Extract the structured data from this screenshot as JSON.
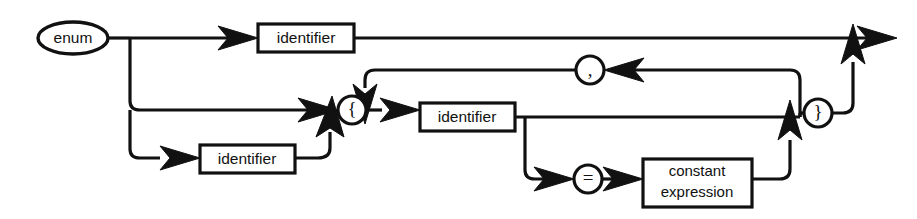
{
  "diagram": {
    "kind": "railroad-syntax-diagram",
    "title": "enum",
    "width": 917,
    "height": 219,
    "background_color": "#ffffff",
    "line_color": "#111111",
    "nodes": {
      "keyword_enum": "enum",
      "identifier_tag": "identifier",
      "identifier_single": "identifier",
      "identifier_list": "identifier",
      "brace_open": "{",
      "brace_close": "}",
      "comma": ",",
      "equals": "=",
      "constant_expression_line1": "constant",
      "constant_expression_line2": "expression"
    },
    "terminals": [
      "enum",
      "{",
      "}",
      ",",
      "="
    ],
    "nonterminals": [
      "identifier",
      "constant expression"
    ]
  }
}
